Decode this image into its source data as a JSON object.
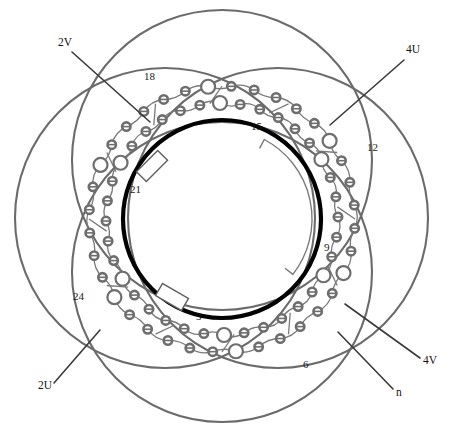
{
  "figure": {
    "type": "patent-line-drawing",
    "background": "#ffffff"
  },
  "colors": {
    "bore_ring": "#000000",
    "coil_arc": "#6b6b6b",
    "node_ring": "#6e6e6e",
    "connector": "#7a7a7a",
    "leader_line": "#3a3a3a",
    "text": "#1a1a1a",
    "tooth_marker": "#5f5f5f"
  },
  "phase_labels": [
    {
      "id": "2V",
      "text": "2V",
      "x": 58,
      "y": 46,
      "leader": {
        "x1": 72,
        "y1": 52,
        "x2": 150,
        "y2": 122
      }
    },
    {
      "id": "4U",
      "text": "4U",
      "x": 406,
      "y": 53,
      "leader": {
        "x1": 404,
        "y1": 60,
        "x2": 330,
        "y2": 125
      }
    },
    {
      "id": "2U",
      "text": "2U",
      "x": 38,
      "y": 389,
      "leader": {
        "x1": 54,
        "y1": 383,
        "x2": 100,
        "y2": 330
      }
    },
    {
      "id": "4V",
      "text": "4V",
      "x": 423,
      "y": 364,
      "leader": {
        "x1": 420,
        "y1": 358,
        "x2": 345,
        "y2": 304
      }
    },
    {
      "id": "n",
      "text": "n",
      "x": 396,
      "y": 396,
      "leader": {
        "x1": 393,
        "y1": 389,
        "x2": 338,
        "y2": 332
      }
    }
  ],
  "slot_labels": [
    {
      "id": "18",
      "text": "18",
      "x": 144,
      "y": 80
    },
    {
      "id": "15",
      "text": "15",
      "x": 251,
      "y": 130
    },
    {
      "id": "12",
      "text": "12",
      "x": 367,
      "y": 151
    },
    {
      "id": "9",
      "text": "9",
      "x": 324,
      "y": 251
    },
    {
      "id": "6",
      "text": "6",
      "x": 303,
      "y": 368
    },
    {
      "id": "3",
      "text": "3",
      "x": 196,
      "y": 320
    },
    {
      "id": "21",
      "text": "21",
      "x": 130,
      "y": 193
    },
    {
      "id": "24",
      "text": "24",
      "x": 73,
      "y": 300
    }
  ],
  "geometry": {
    "center": {
      "cx": 222,
      "cy": 219
    },
    "bore_circle": {
      "r": 99,
      "stroke_width": 4.2
    },
    "inner_node_ring_r": 116,
    "outer_node_ring_r": 133,
    "coil_circles": [
      {
        "name": "coil-top",
        "cx": 222,
        "cy": 160,
        "r": 150
      },
      {
        "name": "coil-bottom",
        "cx": 222,
        "cy": 272,
        "r": 150
      },
      {
        "name": "coil-left",
        "cx": 165,
        "cy": 218,
        "r": 150
      },
      {
        "name": "coil-right",
        "cx": 278,
        "cy": 218,
        "r": 150
      }
    ],
    "coil_stroke_width": 2.1,
    "node_counts": {
      "inner": 36,
      "outer": 36
    },
    "node_small_r": 4.2,
    "node_large_r": 7.0,
    "tooth_markers": [
      {
        "name": "tooth-upper-left",
        "cx": 152,
        "cy": 166,
        "angle": -45
      },
      {
        "name": "tooth-lower-left",
        "cx": 172,
        "cy": 297,
        "angle": 30
      }
    ],
    "gap_arc": {
      "start_deg": -62,
      "end_deg": 38,
      "r": 90
    }
  }
}
